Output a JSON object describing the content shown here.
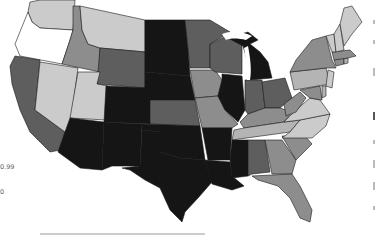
{
  "map": {
    "type": "choropleth",
    "region": "Contiguous United States",
    "color_scale": "grayscale",
    "palette": {
      "darkest": "#151515",
      "dark": "#5e5e5e",
      "mid": "#8d8d8d",
      "light": "#b4b4b4",
      "lighter": "#cbcbcb",
      "white": "#ffffff",
      "border": "#1a1a1a"
    },
    "legend": {
      "labels": [
        "0.99",
        "0"
      ]
    },
    "states": [
      {
        "id": "WA",
        "shade": "lighter"
      },
      {
        "id": "OR",
        "shade": "white"
      },
      {
        "id": "CA",
        "shade": "dark"
      },
      {
        "id": "NV",
        "shade": "lighter"
      },
      {
        "id": "ID",
        "shade": "mid"
      },
      {
        "id": "MT",
        "shade": "lighter"
      },
      {
        "id": "WY",
        "shade": "dark"
      },
      {
        "id": "UT",
        "shade": "lighter"
      },
      {
        "id": "AZ",
        "shade": "darkest"
      },
      {
        "id": "CO",
        "shade": "darkest"
      },
      {
        "id": "NM",
        "shade": "darkest"
      },
      {
        "id": "ND",
        "shade": "darkest"
      },
      {
        "id": "SD",
        "shade": "darkest"
      },
      {
        "id": "NE",
        "shade": "darkest"
      },
      {
        "id": "KS",
        "shade": "dark"
      },
      {
        "id": "OK",
        "shade": "darkest"
      },
      {
        "id": "TX",
        "shade": "darkest"
      },
      {
        "id": "MN",
        "shade": "dark"
      },
      {
        "id": "IA",
        "shade": "mid"
      },
      {
        "id": "MO",
        "shade": "mid"
      },
      {
        "id": "AR",
        "shade": "darkest"
      },
      {
        "id": "LA",
        "shade": "darkest"
      },
      {
        "id": "WI",
        "shade": "dark"
      },
      {
        "id": "IL",
        "shade": "darkest"
      },
      {
        "id": "MI",
        "shade": "darkest"
      },
      {
        "id": "IN",
        "shade": "dark"
      },
      {
        "id": "OH",
        "shade": "dark"
      },
      {
        "id": "KY",
        "shade": "mid"
      },
      {
        "id": "TN",
        "shade": "light"
      },
      {
        "id": "MS",
        "shade": "darkest"
      },
      {
        "id": "AL",
        "shade": "dark"
      },
      {
        "id": "GA",
        "shade": "mid"
      },
      {
        "id": "FL",
        "shade": "mid"
      },
      {
        "id": "SC",
        "shade": "mid"
      },
      {
        "id": "NC",
        "shade": "lighter"
      },
      {
        "id": "VA",
        "shade": "lighter"
      },
      {
        "id": "WV",
        "shade": "mid"
      },
      {
        "id": "PA",
        "shade": "light"
      },
      {
        "id": "NY",
        "shade": "mid"
      },
      {
        "id": "MD",
        "shade": "mid"
      },
      {
        "id": "DE",
        "shade": "light"
      },
      {
        "id": "NJ",
        "shade": "lighter"
      },
      {
        "id": "CT",
        "shade": "mid"
      },
      {
        "id": "RI",
        "shade": "light"
      },
      {
        "id": "MA",
        "shade": "mid"
      },
      {
        "id": "VT",
        "shade": "lighter"
      },
      {
        "id": "NH",
        "shade": "lighter"
      },
      {
        "id": "ME",
        "shade": "lighter"
      }
    ]
  }
}
